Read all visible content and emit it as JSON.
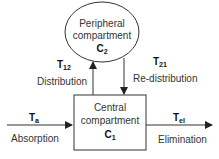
{
  "diagram": {
    "type": "two-compartment pharmacokinetic model",
    "nodes": {
      "peripheral": {
        "line1": "Peripheral",
        "line2": "compartment",
        "symbol": "C",
        "sub": "2",
        "shape": "ellipse"
      },
      "central": {
        "line1": "Central",
        "line2": "compartment",
        "symbol": "C",
        "sub": "1",
        "shape": "rectangle"
      }
    },
    "edges": {
      "distribution": {
        "symbol": "T",
        "sub": "12",
        "label": "Distribution",
        "from": "central",
        "to": "peripheral"
      },
      "redistribution": {
        "symbol": "T",
        "sub": "21",
        "label": "Re-distribution",
        "from": "peripheral",
        "to": "central"
      },
      "absorption": {
        "symbol": "T",
        "sub": "a",
        "label": "Absorption",
        "from": "outside",
        "to": "central"
      },
      "elimination": {
        "symbol": "T",
        "sub": "el",
        "label": "Elimination",
        "from": "central",
        "to": "outside"
      }
    },
    "colors": {
      "stroke": "#333333",
      "background": "#ffffff"
    }
  }
}
